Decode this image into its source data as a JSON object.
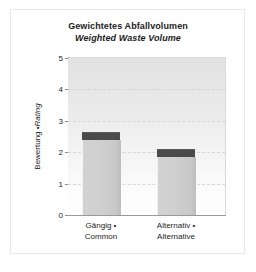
{
  "chart_data": {
    "type": "bar",
    "title": "Gewichtetes Abfallvolumen",
    "subtitle": "Weighted Waste Volume",
    "xlabel": "",
    "ylabel_de": "Bewertung • ",
    "ylabel_en": "Rating",
    "categories": [
      "Gängig •\nCommon",
      "Alternativ •\nAlternative"
    ],
    "category_labels": [
      {
        "line1": "Gängig •",
        "line2": "Common"
      },
      {
        "line1": "Alternativ •",
        "line2": "Alternative"
      }
    ],
    "values": [
      2.6,
      2.07
    ],
    "series": [
      {
        "name": "body",
        "values": [
          2.4,
          1.85
        ],
        "color": "#cdcdcd"
      },
      {
        "name": "cap",
        "values": [
          0.2,
          0.22
        ],
        "color": "#4a4a4a"
      }
    ],
    "ylim": [
      0,
      5
    ],
    "yticks": [
      0,
      1,
      2,
      3,
      4,
      5
    ],
    "ytick_labels": [
      "0",
      "1",
      "2",
      "3",
      "4",
      "5"
    ],
    "grid": true,
    "gridline_style": "dashed",
    "legend": "none",
    "plot_background": "light-gray vertical gradient",
    "bar_color": "#cdcdcd",
    "cap_color": "#4a4a4a",
    "axis_color": "#9a9a9a",
    "text_color": "#1c1c1c"
  }
}
